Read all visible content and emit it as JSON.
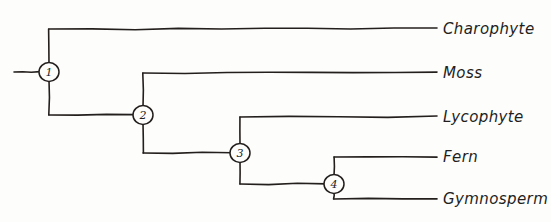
{
  "diagram": {
    "type": "cladogram",
    "style": "hand-drawn",
    "ink_color": "#231f1d",
    "background_color": "#fdfdfc",
    "tip_line_end_x": 437,
    "label_start_x": 443
  },
  "root": {
    "stub_x_start": 14,
    "stub_x_end": 40,
    "y": 72
  },
  "nodes": [
    {
      "id": "node-1",
      "label": "1",
      "cx": 49,
      "cy": 72,
      "r": 10
    },
    {
      "id": "node-2",
      "label": "2",
      "cx": 143,
      "cy": 115,
      "r": 10
    },
    {
      "id": "node-3",
      "label": "3",
      "cx": 240,
      "cy": 153,
      "r": 10
    },
    {
      "id": "node-4",
      "label": "4",
      "cx": 334,
      "cy": 184,
      "r": 10
    }
  ],
  "tips": [
    {
      "id": "tip-charophyte",
      "label": "Charophyte",
      "y": 29,
      "branch_x_start": 49,
      "parent": "node-1"
    },
    {
      "id": "tip-moss",
      "label": "Moss",
      "y": 73,
      "branch_x_start": 143,
      "parent": "node-2"
    },
    {
      "id": "tip-lycophyte",
      "label": "Lycophyte",
      "y": 117,
      "branch_x_start": 240,
      "parent": "node-3"
    },
    {
      "id": "tip-fern",
      "label": "Fern",
      "y": 157,
      "branch_x_start": 334,
      "parent": "node-4"
    },
    {
      "id": "tip-gymnosperm",
      "label": "Gymnosperm",
      "y": 199,
      "branch_x_start": 334,
      "parent": "node-4"
    }
  ],
  "internal_links": [
    {
      "id": "link-1-2",
      "from": "node-1",
      "to": "node-2",
      "drop_x": 49,
      "drop_to_y": 115
    },
    {
      "id": "link-2-3",
      "from": "node-2",
      "to": "node-3",
      "drop_x": 143,
      "drop_to_y": 153
    },
    {
      "id": "link-3-4",
      "from": "node-3",
      "to": "node-4",
      "drop_x": 240,
      "drop_to_y": 184
    }
  ]
}
